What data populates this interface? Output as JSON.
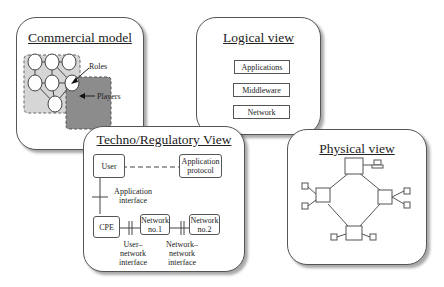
{
  "commercial_model": {
    "title": "Commercial model",
    "labels": {
      "roles": "Roles",
      "players": "Players"
    }
  },
  "logical_view": {
    "title": "Logical view",
    "layers": [
      "Applications",
      "Middleware",
      "Network"
    ]
  },
  "techno_regulatory_view": {
    "title": "Techno/Regulatory View",
    "nodes": {
      "user": "User",
      "application_protocol": "Application protocol",
      "cpe": "CPE",
      "network1": "Network no.1",
      "network2": "Network no.2"
    },
    "interfaces": {
      "application": "Application interface",
      "user_network": "User– network interface",
      "network_network": "Network– network interface"
    }
  },
  "physical_view": {
    "title": "Physical view"
  }
}
